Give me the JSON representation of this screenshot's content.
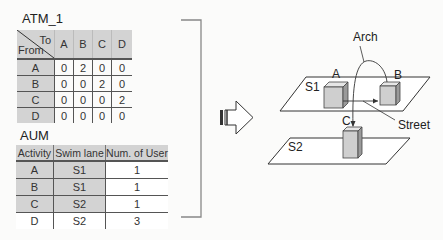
{
  "atm": {
    "title": "ATM_1",
    "corner_to": "To",
    "corner_from": "From",
    "columns": [
      "A",
      "B",
      "C",
      "D"
    ],
    "rows": [
      {
        "label": "A",
        "values": [
          "0",
          "2",
          "0",
          "0"
        ]
      },
      {
        "label": "B",
        "values": [
          "0",
          "0",
          "2",
          "0"
        ]
      },
      {
        "label": "C",
        "values": [
          "0",
          "0",
          "0",
          "2"
        ]
      },
      {
        "label": "D",
        "values": [
          "0",
          "0",
          "0",
          "0"
        ]
      }
    ]
  },
  "aum": {
    "title": "AUM",
    "headers": [
      "Activity",
      "Swim lane",
      "Num. of User"
    ],
    "rows": [
      {
        "activity": "A",
        "swim_lane": "S1",
        "users": "1"
      },
      {
        "activity": "B",
        "swim_lane": "S1",
        "users": "1"
      },
      {
        "activity": "C",
        "swim_lane": "S2",
        "users": "1"
      },
      {
        "activity": "D",
        "swim_lane": "S2",
        "users": "3"
      }
    ]
  },
  "diagram": {
    "arch_label": "Arch",
    "street_label": "Street",
    "plane1_label": "S1",
    "plane2_label": "S2",
    "box_a_label": "A",
    "box_b_label": "B",
    "box_c_label": "C"
  },
  "colors": {
    "header_fill": "#d3d3d3",
    "box_front": "#cfcfcf",
    "box_side": "#9a9a9a",
    "box_top": "#e6e6e6",
    "line": "#333333"
  }
}
